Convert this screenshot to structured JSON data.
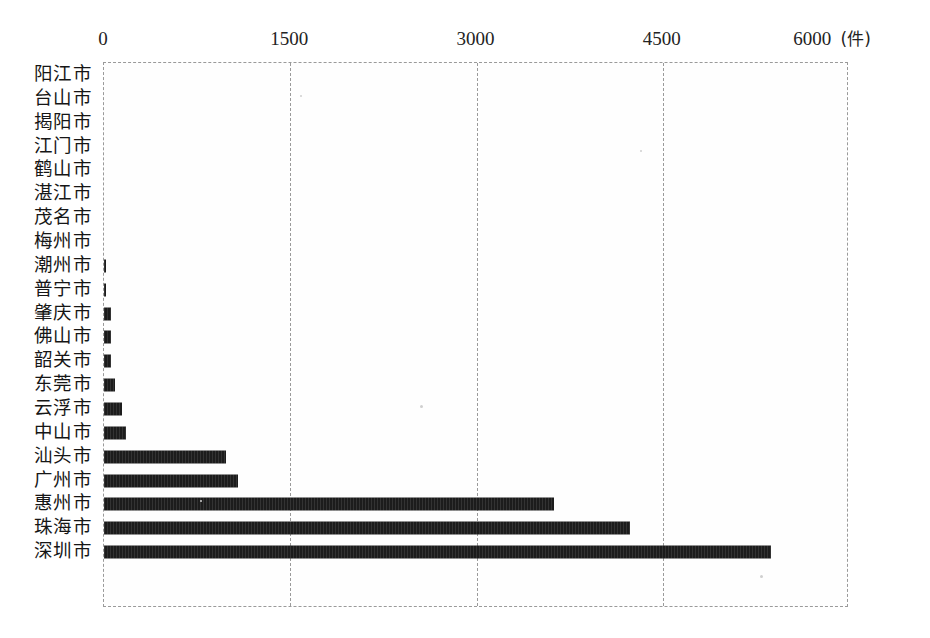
{
  "chart_data": {
    "type": "bar",
    "orientation": "horizontal",
    "title": "",
    "xlabel": "(件)",
    "ylabel": "",
    "xlim": [
      0,
      6000
    ],
    "xticks": [
      0,
      1500,
      3000,
      4500,
      6000
    ],
    "xtick_labels": [
      "0",
      "1500",
      "3000",
      "4500",
      "6000"
    ],
    "unit_label": "(件)",
    "grid": true,
    "grid_axis": "x",
    "legend": false,
    "bar_color": "#1c1c1c",
    "categories": [
      "阳江市",
      "台山市",
      "揭阳市",
      "江门市",
      "鹤山市",
      "湛江市",
      "茂名市",
      "梅州市",
      "潮州市",
      "普宁市",
      "肇庆市",
      "佛山市",
      "韶关市",
      "东莞市",
      "云浮市",
      "中山市",
      "汕头市",
      "广州市",
      "惠州市",
      "珠海市",
      "深圳市"
    ],
    "values": [
      0,
      0,
      0,
      0,
      0,
      0,
      0,
      0,
      5,
      20,
      60,
      60,
      60,
      90,
      145,
      180,
      980,
      1080,
      3625,
      4240,
      5370
    ]
  },
  "axis": {
    "unit_suffix": "(件)"
  }
}
